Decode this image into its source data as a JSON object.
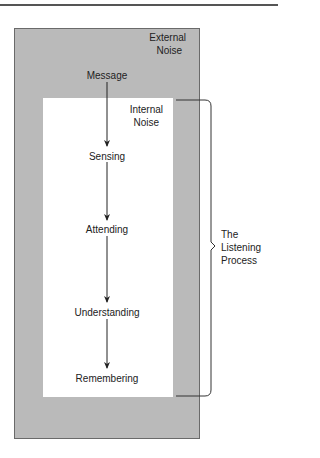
{
  "diagram": {
    "type": "flow",
    "outer_region": {
      "label_line1": "External",
      "label_line2": "Noise",
      "fill": "#bababa"
    },
    "inner_region": {
      "label_line1": "Internal",
      "label_line2": "Noise",
      "fill": "#ffffff"
    },
    "stages": [
      {
        "label": "Message"
      },
      {
        "label": "Sensing"
      },
      {
        "label": "Attending"
      },
      {
        "label": "Understanding"
      },
      {
        "label": "Remembering"
      }
    ],
    "bracket": {
      "label_line1": "The",
      "label_line2": "Listening",
      "label_line3": "Process"
    }
  }
}
